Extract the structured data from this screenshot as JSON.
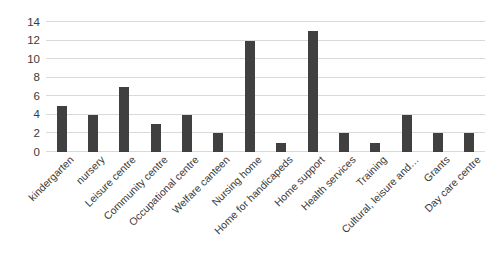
{
  "chart_data": {
    "type": "bar",
    "title": "",
    "xlabel": "",
    "ylabel": "",
    "ylim": [
      0,
      14
    ],
    "ytick_step": 2,
    "yticks": [
      0,
      2,
      4,
      6,
      8,
      10,
      12,
      14
    ],
    "grid": true,
    "legend": false,
    "orientation": "vertical",
    "bar_color": "#404040",
    "gridline_color": "#d9d9d9",
    "xtick_label_rotation": -45,
    "categories": [
      "kindergarten",
      "nursery",
      "Leisure centre",
      "Community centre",
      "Occupational centre",
      "Welfare canteen",
      "Nursing home",
      "Home for handicapeds",
      "Home support",
      "Health services",
      "Training",
      "Cultural, leisure and…",
      "Grants",
      "Day care centre"
    ],
    "values": [
      5,
      4,
      7,
      3,
      4,
      2,
      12,
      1,
      13,
      2,
      1,
      4,
      2,
      2
    ]
  },
  "top_crop_text": ""
}
